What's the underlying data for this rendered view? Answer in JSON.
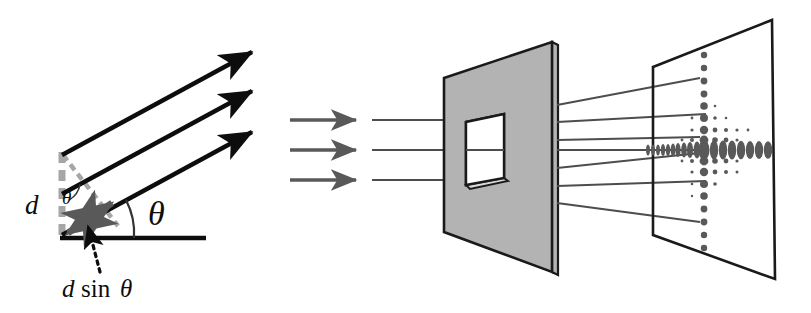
{
  "figure": {
    "domain": "diagram",
    "background_color": "#ffffff"
  },
  "colors": {
    "ink": "#0d0d0d",
    "plate_fill": "#b3b3b3",
    "plate_edge": "#1a1a1a",
    "gray_arrow": "#595959",
    "ray_line": "#4d4d4d",
    "dot": "#595959",
    "dashed_gray": "#a6a6a6"
  },
  "left_panel": {
    "name": "grating-path-difference-diagram",
    "labels": {
      "spacing": "d",
      "angle_large": "θ",
      "angle_small": "θ",
      "path_difference_d": "d",
      "path_difference_sin": "sin",
      "path_difference_theta": "θ",
      "path_difference_full": "d sinθ"
    },
    "rays": [
      {
        "name": "outgoing-ray-top",
        "x1": 62,
        "y1": 155,
        "x2": 258,
        "y2": 49
      },
      {
        "name": "outgoing-ray-middle",
        "x1": 62,
        "y1": 194,
        "x2": 258,
        "y2": 88
      },
      {
        "name": "outgoing-ray-bottom",
        "x1": 62,
        "y1": 235,
        "x2": 258,
        "y2": 130
      }
    ],
    "baseline": {
      "x1": 62,
      "y1": 238,
      "x2": 206,
      "y2": 238
    },
    "grating_spacing_bar": {
      "x": 62,
      "y_top": 155,
      "y_bottom": 238
    },
    "angle_arc_radius": 72,
    "angle_value_deg": 28
  },
  "middle_panel": {
    "name": "aperture-plate",
    "incident_arrows": [
      {
        "name": "incident-arrow-top",
        "x1": 290,
        "y1": 120,
        "x2": 360,
        "y2": 120
      },
      {
        "name": "incident-arrow-middle",
        "x1": 290,
        "y1": 150,
        "x2": 360,
        "y2": 150
      },
      {
        "name": "incident-arrow-bottom",
        "x1": 290,
        "y1": 180,
        "x2": 360,
        "y2": 180
      }
    ],
    "incident_rays": [
      {
        "name": "incident-ray-top",
        "x1": 372,
        "y1": 120,
        "x2": 500,
        "y2": 120
      },
      {
        "name": "incident-ray-middle",
        "x1": 372,
        "y1": 150,
        "x2": 500,
        "y2": 150
      },
      {
        "name": "incident-ray-bottom",
        "x1": 372,
        "y1": 180,
        "x2": 500,
        "y2": 180
      }
    ],
    "plate": {
      "face": "444,78 552,42 552,272 444,232",
      "edge": "552,42 558,45 558,275 552,272"
    },
    "aperture": {
      "face": "466,122 504,114 504,178 466,185",
      "depth": "466,185 504,178 508,181 470,188"
    }
  },
  "right_panel": {
    "name": "detection-screen",
    "screen": {
      "outline": "653,67 772,20 775,279 653,235"
    },
    "diffracted_rays": [
      {
        "name": "diffracted-ray-1",
        "x1": 556,
        "y1": 105,
        "x2": 700,
        "y2": 78
      },
      {
        "name": "diffracted-ray-2",
        "x1": 556,
        "y1": 122,
        "x2": 710,
        "y2": 113
      },
      {
        "name": "diffracted-ray-3",
        "x1": 556,
        "y1": 140,
        "x2": 716,
        "y2": 136
      },
      {
        "name": "diffracted-ray-4",
        "x1": 556,
        "y1": 150,
        "x2": 718,
        "y2": 149
      },
      {
        "name": "diffracted-ray-5",
        "x1": 556,
        "y1": 168,
        "x2": 716,
        "y2": 155
      },
      {
        "name": "diffracted-ray-6",
        "x1": 556,
        "y1": 186,
        "x2": 710,
        "y2": 180
      },
      {
        "name": "diffracted-ray-7",
        "x1": 556,
        "y1": 203,
        "x2": 700,
        "y2": 220
      }
    ]
  },
  "chart_data": {
    "type": "scatter",
    "xlabel": "",
    "ylabel": "",
    "center": {
      "x": 704,
      "y": 150
    },
    "dot_color": "#595959",
    "central_row": {
      "name": "central-horizontal-order-row",
      "y": 150,
      "dots": [
        {
          "x": 648,
          "rx": 2.0,
          "ry": 5.5
        },
        {
          "x": 653,
          "rx": 2.0,
          "ry": 5.5
        },
        {
          "x": 658,
          "rx": 2.0,
          "ry": 5.5
        },
        {
          "x": 663,
          "rx": 2.2,
          "ry": 6.0
        },
        {
          "x": 668,
          "rx": 2.2,
          "ry": 6.0
        },
        {
          "x": 673,
          "rx": 2.4,
          "ry": 6.5
        },
        {
          "x": 678,
          "rx": 2.6,
          "ry": 7.0
        },
        {
          "x": 684,
          "rx": 2.8,
          "ry": 7.5
        },
        {
          "x": 690,
          "rx": 3.0,
          "ry": 8.0
        },
        {
          "x": 697,
          "rx": 3.4,
          "ry": 8.5
        },
        {
          "x": 704,
          "rx": 5.5,
          "ry": 10.0
        },
        {
          "x": 714,
          "rx": 4.2,
          "ry": 9.5
        },
        {
          "x": 723,
          "rx": 4.2,
          "ry": 9.5
        },
        {
          "x": 732,
          "rx": 4.2,
          "ry": 9.5
        },
        {
          "x": 741,
          "rx": 4.2,
          "ry": 9.2
        },
        {
          "x": 750,
          "rx": 4.2,
          "ry": 9.0
        },
        {
          "x": 759,
          "rx": 4.2,
          "ry": 9.0
        },
        {
          "x": 768,
          "rx": 4.2,
          "ry": 8.8
        }
      ]
    },
    "central_column": {
      "name": "central-vertical-order-column",
      "x": 704,
      "dots": [
        {
          "y": 55,
          "rx": 3.2,
          "ry": 3.2
        },
        {
          "y": 68,
          "rx": 3.2,
          "ry": 3.2
        },
        {
          "y": 81,
          "rx": 3.4,
          "ry": 3.4
        },
        {
          "y": 94,
          "rx": 3.4,
          "ry": 3.4
        },
        {
          "y": 106,
          "rx": 3.8,
          "ry": 3.8
        },
        {
          "y": 118,
          "rx": 4.0,
          "ry": 4.0
        },
        {
          "y": 130,
          "rx": 4.2,
          "ry": 4.2
        },
        {
          "y": 140,
          "rx": 4.4,
          "ry": 4.4
        },
        {
          "y": 161,
          "rx": 4.4,
          "ry": 4.4
        },
        {
          "y": 172,
          "rx": 4.2,
          "ry": 4.2
        },
        {
          "y": 184,
          "rx": 4.0,
          "ry": 4.0
        },
        {
          "y": 196,
          "rx": 3.8,
          "ry": 3.8
        },
        {
          "y": 209,
          "rx": 3.4,
          "ry": 3.4
        },
        {
          "y": 222,
          "rx": 3.4,
          "ry": 3.4
        },
        {
          "y": 235,
          "rx": 3.2,
          "ry": 3.2
        },
        {
          "y": 248,
          "rx": 3.2,
          "ry": 3.2
        }
      ]
    },
    "off_axis_rows": [
      {
        "name": "off-axis-row-up-1",
        "y": 130,
        "dots": [
          {
            "x": 692,
            "rx": 1.6,
            "ry": 1.6
          },
          {
            "x": 715,
            "rx": 2.4,
            "ry": 2.4
          },
          {
            "x": 726,
            "rx": 2.0,
            "ry": 2.0
          },
          {
            "x": 737,
            "rx": 1.6,
            "ry": 1.6
          },
          {
            "x": 748,
            "rx": 1.4,
            "ry": 1.4
          }
        ]
      },
      {
        "name": "off-axis-row-up-2",
        "y": 140,
        "dots": [
          {
            "x": 682,
            "rx": 1.4,
            "ry": 1.4
          },
          {
            "x": 692,
            "rx": 2.0,
            "ry": 2.0
          },
          {
            "x": 715,
            "rx": 2.8,
            "ry": 2.8
          },
          {
            "x": 726,
            "rx": 2.4,
            "ry": 2.4
          },
          {
            "x": 737,
            "rx": 1.6,
            "ry": 1.6
          }
        ]
      },
      {
        "name": "off-axis-row-up-3",
        "y": 118,
        "dots": [
          {
            "x": 692,
            "rx": 1.4,
            "ry": 1.4
          },
          {
            "x": 715,
            "rx": 1.8,
            "ry": 1.8
          },
          {
            "x": 726,
            "rx": 1.3,
            "ry": 1.3
          }
        ]
      },
      {
        "name": "off-axis-row-up-4",
        "y": 106,
        "dots": [
          {
            "x": 715,
            "rx": 1.3,
            "ry": 1.3
          }
        ]
      },
      {
        "name": "off-axis-row-down-1",
        "y": 161,
        "dots": [
          {
            "x": 682,
            "rx": 1.4,
            "ry": 1.4
          },
          {
            "x": 692,
            "rx": 2.0,
            "ry": 2.0
          },
          {
            "x": 715,
            "rx": 2.8,
            "ry": 2.8
          },
          {
            "x": 726,
            "rx": 2.4,
            "ry": 2.4
          },
          {
            "x": 737,
            "rx": 1.6,
            "ry": 1.6
          }
        ]
      },
      {
        "name": "off-axis-row-down-2",
        "y": 172,
        "dots": [
          {
            "x": 692,
            "rx": 1.6,
            "ry": 1.6
          },
          {
            "x": 715,
            "rx": 2.4,
            "ry": 2.4
          },
          {
            "x": 726,
            "rx": 2.0,
            "ry": 2.0
          },
          {
            "x": 737,
            "rx": 1.5,
            "ry": 1.5
          }
        ]
      },
      {
        "name": "off-axis-row-down-3",
        "y": 184,
        "dots": [
          {
            "x": 692,
            "rx": 1.3,
            "ry": 1.3
          },
          {
            "x": 715,
            "rx": 1.8,
            "ry": 1.8
          }
        ]
      },
      {
        "name": "off-axis-row-down-4",
        "y": 196,
        "dots": [
          {
            "x": 692,
            "rx": 1.2,
            "ry": 1.2
          }
        ]
      }
    ]
  }
}
